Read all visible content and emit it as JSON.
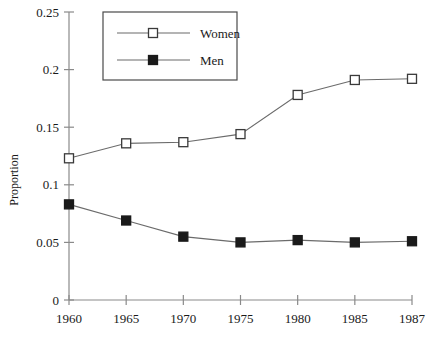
{
  "chart_data": {
    "type": "line",
    "title": "",
    "subtitle": "",
    "xlabel": "",
    "ylabel": "Proportion",
    "categories": [
      "1960",
      "1965",
      "1970",
      "1975",
      "1980",
      "1985",
      "1987"
    ],
    "x_tick_labels": [
      "1960",
      "1965",
      "1970",
      "1975",
      "1980",
      "1985",
      "1987"
    ],
    "y_tick_labels": [
      "0",
      "0.05",
      "0.1",
      "0.15",
      "0.2",
      "0.25"
    ],
    "y_tick_values": [
      0,
      0.05,
      0.1,
      0.15,
      0.2,
      0.25
    ],
    "ylim": [
      0,
      0.25
    ],
    "grid": false,
    "legend_position": "top-left-inside",
    "series": [
      {
        "name": "Women",
        "marker": "open-square",
        "marker_fill": "#ffffff",
        "marker_stroke": "#3a3a3a",
        "line_color": "#6b6b6b",
        "values": [
          0.123,
          0.136,
          0.137,
          0.144,
          0.178,
          0.191,
          0.192
        ]
      },
      {
        "name": "Men",
        "marker": "filled-square",
        "marker_fill": "#1a1a1a",
        "marker_stroke": "#1a1a1a",
        "line_color": "#6b6b6b",
        "values": [
          0.083,
          0.069,
          0.055,
          0.05,
          0.052,
          0.05,
          0.051
        ]
      }
    ]
  },
  "legend": {
    "entries": [
      {
        "label": "Women"
      },
      {
        "label": "Men"
      }
    ]
  },
  "axes": {
    "y_title": "Proportion"
  },
  "colors": {
    "axis": "#8a8a8a",
    "line": "#6b6b6b",
    "text": "#1a1a1a",
    "legend_border": "#4a4a4a",
    "background": "#ffffff"
  }
}
